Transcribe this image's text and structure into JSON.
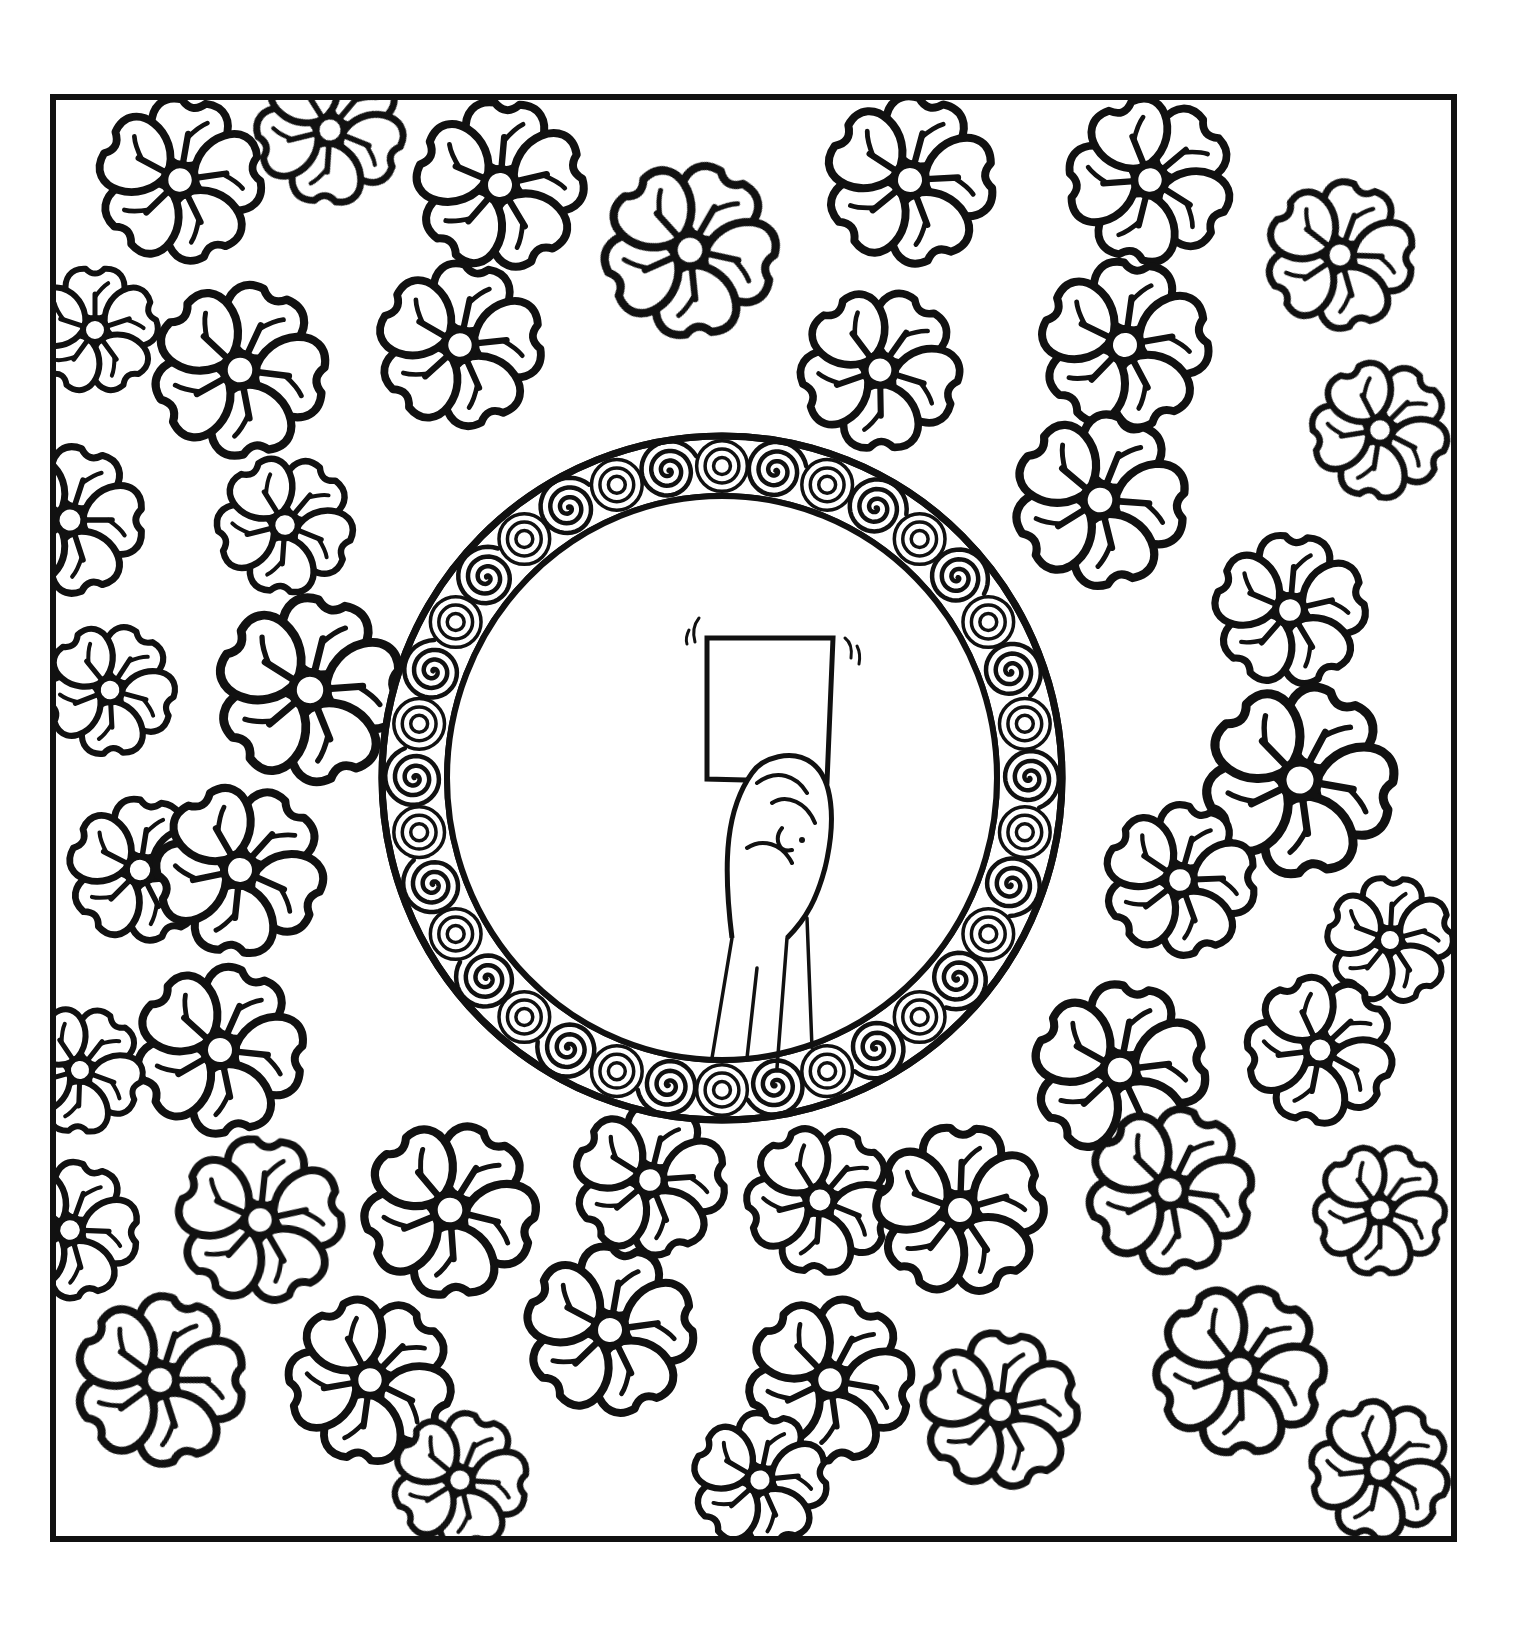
{
  "canvas": {
    "width": 1520,
    "height": 1632,
    "background": "#ffffff"
  },
  "colors": {
    "ink": "#111111",
    "paper": "#ffffff"
  },
  "frame": {
    "x": 53,
    "y": 97,
    "width": 1401,
    "height": 1442,
    "stroke": 6
  },
  "flowers": [
    {
      "x": 180,
      "y": 180,
      "r": 78,
      "rot": 10
    },
    {
      "x": 330,
      "y": 130,
      "r": 70,
      "rot": 40
    },
    {
      "x": 500,
      "y": 185,
      "r": 80,
      "rot": 5
    },
    {
      "x": 690,
      "y": 250,
      "r": 82,
      "rot": 30
    },
    {
      "x": 910,
      "y": 180,
      "r": 80,
      "rot": 15
    },
    {
      "x": 1150,
      "y": 180,
      "r": 78,
      "rot": 50
    },
    {
      "x": 1340,
      "y": 255,
      "r": 70,
      "rot": 20
    },
    {
      "x": 95,
      "y": 330,
      "r": 60,
      "rot": 0
    },
    {
      "x": 240,
      "y": 370,
      "r": 82,
      "rot": 25
    },
    {
      "x": 460,
      "y": 345,
      "r": 78,
      "rot": 12
    },
    {
      "x": 880,
      "y": 370,
      "r": 76,
      "rot": 35
    },
    {
      "x": 1125,
      "y": 345,
      "r": 80,
      "rot": 8
    },
    {
      "x": 1380,
      "y": 430,
      "r": 65,
      "rot": 45
    },
    {
      "x": 70,
      "y": 520,
      "r": 70,
      "rot": 18
    },
    {
      "x": 285,
      "y": 525,
      "r": 65,
      "rot": 40
    },
    {
      "x": 1100,
      "y": 500,
      "r": 82,
      "rot": 22
    },
    {
      "x": 1290,
      "y": 610,
      "r": 72,
      "rot": 5
    },
    {
      "x": 310,
      "y": 690,
      "r": 88,
      "rot": 14
    },
    {
      "x": 110,
      "y": 690,
      "r": 62,
      "rot": 33
    },
    {
      "x": 1300,
      "y": 780,
      "r": 90,
      "rot": 28
    },
    {
      "x": 140,
      "y": 870,
      "r": 68,
      "rot": 9
    },
    {
      "x": 240,
      "y": 870,
      "r": 80,
      "rot": 42
    },
    {
      "x": 1180,
      "y": 880,
      "r": 72,
      "rot": 16
    },
    {
      "x": 1390,
      "y": 940,
      "r": 60,
      "rot": 3
    },
    {
      "x": 220,
      "y": 1050,
      "r": 80,
      "rot": 24
    },
    {
      "x": 80,
      "y": 1070,
      "r": 60,
      "rot": 38
    },
    {
      "x": 1120,
      "y": 1070,
      "r": 82,
      "rot": 11
    },
    {
      "x": 1320,
      "y": 1050,
      "r": 70,
      "rot": 47
    },
    {
      "x": 70,
      "y": 1230,
      "r": 65,
      "rot": 20
    },
    {
      "x": 260,
      "y": 1220,
      "r": 78,
      "rot": 6
    },
    {
      "x": 450,
      "y": 1210,
      "r": 82,
      "rot": 32
    },
    {
      "x": 650,
      "y": 1180,
      "r": 72,
      "rot": 14
    },
    {
      "x": 820,
      "y": 1200,
      "r": 70,
      "rot": 40
    },
    {
      "x": 960,
      "y": 1210,
      "r": 80,
      "rot": 2
    },
    {
      "x": 1170,
      "y": 1190,
      "r": 78,
      "rot": 26
    },
    {
      "x": 1380,
      "y": 1210,
      "r": 62,
      "rot": 36
    },
    {
      "x": 160,
      "y": 1380,
      "r": 80,
      "rot": 18
    },
    {
      "x": 370,
      "y": 1380,
      "r": 78,
      "rot": 44
    },
    {
      "x": 610,
      "y": 1330,
      "r": 80,
      "rot": 10
    },
    {
      "x": 830,
      "y": 1380,
      "r": 78,
      "rot": 28
    },
    {
      "x": 1000,
      "y": 1410,
      "r": 74,
      "rot": 7
    },
    {
      "x": 1240,
      "y": 1370,
      "r": 80,
      "rot": 34
    },
    {
      "x": 460,
      "y": 1480,
      "r": 64,
      "rot": 22
    },
    {
      "x": 760,
      "y": 1480,
      "r": 64,
      "rot": 12
    },
    {
      "x": 1380,
      "y": 1470,
      "r": 66,
      "rot": 48
    }
  ],
  "ring": {
    "cx": 722,
    "cy": 778,
    "rx_outer": 340,
    "ry_outer": 342,
    "rx_inner": 275,
    "ry_inner": 282,
    "swirl_count": 18
  },
  "card": {
    "x": 707,
    "y": 638,
    "width": 126,
    "height": 144
  },
  "hand": {
    "description": "raised fist holding card"
  },
  "icons": {
    "ring": "swirl-ring-icon",
    "card": "red-card-icon",
    "hand": "fist-icon",
    "flower": "flower-icon"
  }
}
